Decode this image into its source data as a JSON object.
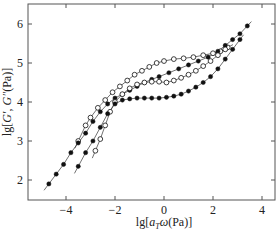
{
  "chart_data": {
    "type": "scatter",
    "title": "",
    "xlabel": "lg[a_T ω(Pa)]",
    "ylabel": "lg[G′, G″(Pa)]",
    "xlabel_parts": {
      "pre": "lg[",
      "italic": "a",
      "sub": "T",
      "italic2": "ω",
      "post": "(Pa)]"
    },
    "ylabel_parts": {
      "pre": "lg[",
      "italic": "G′",
      "mid": ", ",
      "italic2": "G″",
      "post": "(Pa)]"
    },
    "xlim": [
      -5.4,
      4.5
    ],
    "ylim": [
      1.5,
      6.5
    ],
    "xticks": [
      -4,
      -2,
      0,
      2,
      4
    ],
    "xtick_labels": [
      "−4",
      "−2",
      "0",
      "2",
      "4"
    ],
    "yticks": [
      2,
      3,
      4,
      5,
      6
    ],
    "ytick_labels": [
      "2",
      "3",
      "4",
      "5",
      "6"
    ],
    "grid": false,
    "legend": null,
    "series": [
      {
        "name": "G″ (sample A)",
        "marker": "open-circle",
        "x": [
          -3.5,
          -3.2,
          -3.0,
          -2.7,
          -2.4,
          -2.1,
          -1.8,
          -1.5,
          -1.2,
          -0.9,
          -0.6,
          -0.3,
          0.0,
          0.4,
          0.8,
          1.2,
          1.6,
          2.0,
          2.3,
          2.6
        ],
        "y": [
          3.0,
          3.4,
          3.6,
          3.85,
          4.05,
          4.25,
          4.4,
          4.55,
          4.7,
          4.8,
          4.9,
          5.0,
          5.05,
          5.1,
          5.12,
          5.15,
          5.2,
          5.25,
          5.3,
          5.4
        ]
      },
      {
        "name": "G′ (sample A)",
        "marker": "filled-circle",
        "x": [
          -4.7,
          -4.4,
          -4.1,
          -3.8,
          -3.5,
          -3.2,
          -2.9,
          -2.6,
          -2.3,
          -2.0,
          -1.7,
          -1.4,
          -1.1,
          -0.8,
          -0.5,
          -0.2,
          0.2,
          0.6,
          1.0,
          1.4,
          1.8,
          2.2,
          2.5,
          2.8,
          3.1,
          3.4
        ],
        "y": [
          1.9,
          2.15,
          2.4,
          2.7,
          2.95,
          3.2,
          3.5,
          3.75,
          3.95,
          4.1,
          4.2,
          4.3,
          4.4,
          4.5,
          4.58,
          4.65,
          4.75,
          4.85,
          4.95,
          5.05,
          5.15,
          5.3,
          5.45,
          5.6,
          5.75,
          5.95
        ]
      },
      {
        "name": "G″ (sample B)",
        "marker": "open-circle",
        "x": [
          -2.8,
          -2.6,
          -2.4,
          -2.2,
          -2.0,
          -1.7,
          -1.4,
          -1.1,
          -0.8,
          -0.5,
          -0.2,
          0.1,
          0.4,
          0.7,
          1.0,
          1.3,
          1.6,
          1.9,
          2.2,
          2.5
        ],
        "y": [
          2.75,
          3.05,
          3.4,
          3.75,
          4.0,
          4.2,
          4.35,
          4.45,
          4.5,
          4.52,
          4.52,
          4.5,
          4.55,
          4.62,
          4.7,
          4.8,
          4.92,
          5.05,
          5.2,
          5.35
        ]
      },
      {
        "name": "G′ (sample B)",
        "marker": "filled-circle",
        "x": [
          -3.5,
          -3.2,
          -2.9,
          -2.6,
          -2.3,
          -2.0,
          -1.7,
          -1.4,
          -1.1,
          -0.8,
          -0.5,
          -0.2,
          0.1,
          0.4,
          0.7,
          1.0,
          1.3,
          1.6,
          1.9,
          2.2,
          2.5,
          2.8,
          3.1
        ],
        "y": [
          2.35,
          2.7,
          3.0,
          3.35,
          3.7,
          3.95,
          4.05,
          4.08,
          4.1,
          4.1,
          4.1,
          4.1,
          4.12,
          4.15,
          4.2,
          4.28,
          4.38,
          4.5,
          4.65,
          4.85,
          5.1,
          5.35,
          5.6
        ]
      }
    ]
  }
}
